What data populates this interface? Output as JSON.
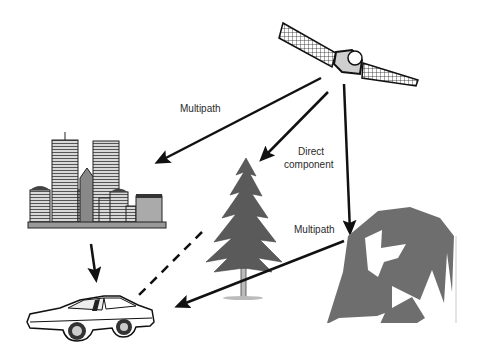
{
  "diagram": {
    "labels": {
      "multipath_top": "Multipath",
      "direct_line1": "Direct",
      "direct_line2": "component",
      "multipath_right": "Multipath"
    },
    "nodes": [
      {
        "id": "satellite",
        "name": "Satellite"
      },
      {
        "id": "buildings",
        "name": "City buildings"
      },
      {
        "id": "tree",
        "name": "Tree"
      },
      {
        "id": "mountain",
        "name": "Mountain / terrain"
      },
      {
        "id": "car",
        "name": "Car (receiver)"
      }
    ],
    "edges": [
      {
        "from": "satellite",
        "to": "buildings",
        "style": "solid",
        "label": "Multipath"
      },
      {
        "from": "satellite",
        "to": "tree",
        "style": "solid",
        "label": "Direct component"
      },
      {
        "from": "satellite",
        "to": "mountain",
        "style": "solid"
      },
      {
        "from": "buildings",
        "to": "car",
        "style": "solid"
      },
      {
        "from": "tree",
        "to": "car",
        "style": "dashed"
      },
      {
        "from": "mountain",
        "to": "car",
        "style": "solid",
        "label": "Multipath"
      }
    ],
    "colors": {
      "line": "#111111",
      "mountain": "#6e6e6e",
      "tree": "#5a5a5a",
      "building": "#b8b8b8"
    }
  }
}
